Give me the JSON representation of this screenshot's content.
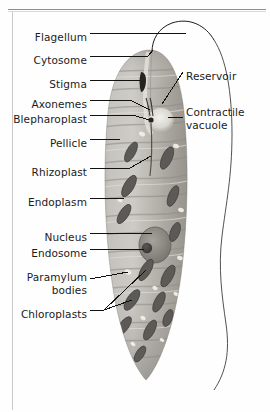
{
  "figure": {
    "style": "labelled light-micrograph line diagram",
    "palette": {
      "background": "#fefefe",
      "leader_line": "#111111",
      "label_text": "#1b1b1b",
      "cell_light": "#c9c7c2",
      "cell_mid": "#a7a49d",
      "cell_dark": "#6f6d68",
      "chloroplast": "#5d5b57",
      "nucleus": "#86837c",
      "endosome": "#3d3b38",
      "paramylum": "#efeee9",
      "outline": "#4a4a4a"
    },
    "labels_left": [
      {
        "name": "flagellum",
        "text": "Flagellum",
        "x": 87,
        "y": 37
      },
      {
        "name": "cytosome",
        "text": "Cytosome",
        "x": 87,
        "y": 60
      },
      {
        "name": "stigma",
        "text": "Stigma",
        "x": 87,
        "y": 84
      },
      {
        "name": "axonemes",
        "text": "Axonemes",
        "x": 87,
        "y": 104
      },
      {
        "name": "blepharoplast",
        "text": "Blepharoplast",
        "x": 87,
        "y": 119
      },
      {
        "name": "pellicle",
        "text": "Pellicle",
        "x": 87,
        "y": 143
      },
      {
        "name": "rhizoplast",
        "text": "Rhizoplast",
        "x": 87,
        "y": 172
      },
      {
        "name": "endoplasm",
        "text": "Endoplasm",
        "x": 87,
        "y": 202
      },
      {
        "name": "nucleus",
        "text": "Nucleus",
        "x": 87,
        "y": 237
      },
      {
        "name": "endosome",
        "text": "Endosome",
        "x": 87,
        "y": 253
      },
      {
        "name": "chloroplasts",
        "text": "Chloroplasts",
        "x": 87,
        "y": 314
      }
    ],
    "labels_left_multiline": [
      {
        "name": "paramylum-bodies",
        "line1": "Paramylum",
        "line2": "bodies",
        "x": 87,
        "y": 277
      }
    ],
    "labels_right": [
      {
        "name": "reservoir",
        "text": "Reservoir",
        "x": 186,
        "y": 76
      }
    ],
    "labels_right_multiline": [
      {
        "name": "contractile-vacuole",
        "line1": "Contractile",
        "line2": "vacuole",
        "x": 186,
        "y": 112
      }
    ],
    "structures": [
      "Flagellum",
      "Cytosome",
      "Stigma",
      "Axonemes",
      "Blepharoplast",
      "Pellicle",
      "Rhizoplast",
      "Endoplasm",
      "Nucleus",
      "Endosome",
      "Paramylum bodies",
      "Chloroplasts",
      "Reservoir",
      "Contractile vacuole"
    ]
  }
}
